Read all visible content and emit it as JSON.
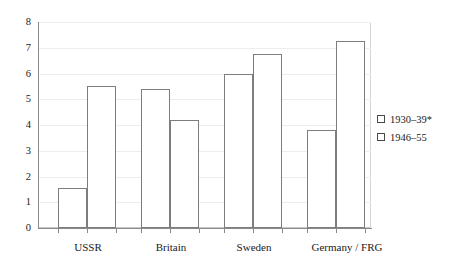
{
  "chart_data": {
    "type": "bar",
    "title": "",
    "subtitle": "",
    "xlabel": "",
    "ylabel": "",
    "categories": [
      "USSR",
      "Britain",
      "Sweden",
      "Germany / FRG"
    ],
    "series": [
      {
        "name": "1930–39*",
        "values": [
          1.55,
          5.4,
          6.0,
          3.8
        ]
      },
      {
        "name": "1946–55",
        "values": [
          5.5,
          4.2,
          6.75,
          7.25
        ]
      }
    ],
    "ylim": [
      0,
      8
    ],
    "ytick_labels": [
      "0",
      "1",
      "2",
      "3",
      "4",
      "5",
      "6",
      "7",
      "8"
    ],
    "ytick_values": [
      0,
      1,
      2,
      3,
      4,
      5,
      6,
      7,
      8
    ],
    "grid": true,
    "grid_axis": "y",
    "legend_position": "right",
    "bar_style": "hollow-outline",
    "colors": {
      "bar_fill": "#ffffff",
      "bar_outline": "#7d7d7d",
      "axis": "#8a8a8a",
      "grid": "#ededed",
      "text": "#1a1a1a",
      "background": "#ffffff"
    }
  },
  "legend": {
    "items": [
      {
        "label": "1930–39*"
      },
      {
        "label": "1946–55"
      }
    ]
  },
  "axis": {
    "y": {
      "t8": "8",
      "t7": "7",
      "t6": "6",
      "t5": "5",
      "t4": "4",
      "t3": "3",
      "t2": "2",
      "t1": "1",
      "t0": "0"
    },
    "x": {
      "c0": "USSR",
      "c1": "Britain",
      "c2": "Sweden",
      "c3": "Germany / FRG"
    }
  }
}
